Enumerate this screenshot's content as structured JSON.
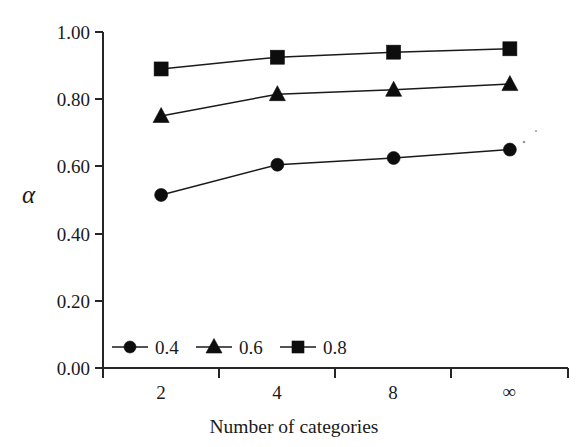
{
  "chart_data": {
    "type": "line",
    "title": "",
    "subtitle": "",
    "xlabel": "Number of categories",
    "ylabel": "α",
    "categories": [
      "2",
      "4",
      "8",
      "∞"
    ],
    "ylim": [
      0.0,
      1.0
    ],
    "yticks": [
      "0.00",
      "0.20",
      "0.40",
      "0.60",
      "0.80",
      "1.00"
    ],
    "ytick_values": [
      0.0,
      0.2,
      0.4,
      0.6,
      0.8,
      1.0
    ],
    "grid": false,
    "legend_position": "inside-bottom-left",
    "series": [
      {
        "name": "0.4",
        "marker": "circle",
        "color": "#0d0d0d",
        "values": [
          0.515,
          0.605,
          0.625,
          0.65
        ]
      },
      {
        "name": "0.6",
        "marker": "triangle",
        "color": "#0d0d0d",
        "values": [
          0.75,
          0.815,
          0.828,
          0.845
        ]
      },
      {
        "name": "0.8",
        "marker": "square",
        "color": "#0d0d0d",
        "values": [
          0.89,
          0.925,
          0.94,
          0.95
        ]
      }
    ]
  },
  "axes": {
    "y_tick_labels": [
      "1.00",
      "0.80",
      "0.60",
      "0.40",
      "0.20",
      "0.00"
    ],
    "x_tick_labels": [
      "2",
      "4",
      "8",
      "∞"
    ],
    "y_axis_title": "α",
    "x_axis_title": "Number of categories"
  },
  "legend": {
    "entries": [
      {
        "label": "0.4",
        "marker": "circle-marker"
      },
      {
        "label": "0.6",
        "marker": "triangle-marker"
      },
      {
        "label": "0.8",
        "marker": "square-marker"
      }
    ]
  },
  "style": {
    "background": "#ffffff",
    "ink": "#1a1a1a",
    "marker_fill": "#0d0d0d"
  }
}
